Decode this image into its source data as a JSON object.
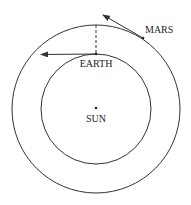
{
  "diagram": {
    "labels": {
      "mars": "MARS",
      "earth": "EARTH",
      "sun": "SUN"
    },
    "colors": {
      "line": "#333333",
      "background": "#ffffff"
    },
    "geometry": {
      "center": [
        96,
        109
      ],
      "outer_orbit_radius": 84,
      "inner_orbit_radius": 55
    }
  }
}
